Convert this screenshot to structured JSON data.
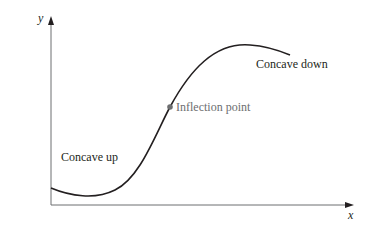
{
  "diagram": {
    "type": "concavity-curve",
    "axes": {
      "x_label": "x",
      "y_label": "y"
    },
    "labels": {
      "concave_up": "Concave up",
      "concave_down": "Concave down",
      "inflection_point": "Inflection point"
    },
    "colors": {
      "curve": "#231f20",
      "axes": "#6d6e70",
      "inflection_point": "#6d6e70",
      "inflection_label": "#6d6e70"
    }
  }
}
